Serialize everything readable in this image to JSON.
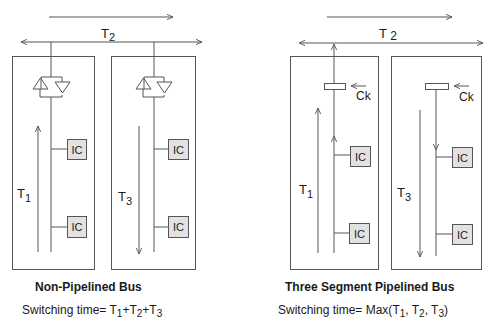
{
  "diagrams": [
    {
      "id": "non-pipelined",
      "title": "Non-Pipelined Bus",
      "formula": {
        "prefix": "Switching time= ",
        "terms": [
          {
            "base": "T",
            "sub": "1"
          },
          {
            "sep": "+"
          },
          {
            "base": "T",
            "sub": "2"
          },
          {
            "sep": "+"
          },
          {
            "base": "T",
            "sub": "3"
          }
        ]
      },
      "span_label": {
        "base": "T",
        "sub": "2"
      },
      "segments": [
        {
          "time_label": {
            "base": "T",
            "sub": "1"
          },
          "direction": "up",
          "ic_labels": [
            "IC",
            "IC"
          ],
          "coupler": "bidirectional-buffer"
        },
        {
          "time_label": {
            "base": "T",
            "sub": "3"
          },
          "direction": "down",
          "ic_labels": [
            "IC",
            "IC"
          ],
          "coupler": "bidirectional-buffer"
        }
      ]
    },
    {
      "id": "three-segment-pipelined",
      "title": "Three Segment Pipelined Bus",
      "formula": {
        "prefix": "Switching time= Max(",
        "terms": [
          {
            "base": "T",
            "sub": "1"
          },
          {
            "sep": ", "
          },
          {
            "base": "T",
            "sub": "2"
          },
          {
            "sep": ", "
          },
          {
            "base": "T",
            "sub": "3"
          }
        ],
        "suffix": ")"
      },
      "span_label": {
        "base": "T ",
        "sub": "2"
      },
      "clock_label": "Ck",
      "segments": [
        {
          "time_label": {
            "base": "T",
            "sub": "1"
          },
          "direction": "up",
          "ic_labels": [
            "IC",
            "IC"
          ],
          "coupler": "register"
        },
        {
          "time_label": {
            "base": "T",
            "sub": "3"
          },
          "direction": "down",
          "ic_labels": [
            "IC",
            "IC"
          ],
          "coupler": "register"
        }
      ]
    }
  ],
  "colors": {
    "line": "#555555",
    "ic_fill": "#e2e2e2",
    "text": "#1a1a1a"
  }
}
